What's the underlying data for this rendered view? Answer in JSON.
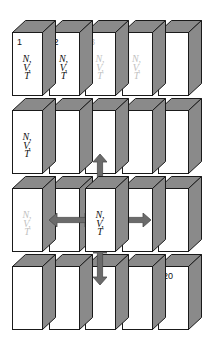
{
  "figure": {
    "kind": "isometric-box-grid",
    "rows": 4,
    "cols": 5,
    "box_fill": "#ffffff",
    "box_shade": "#8a8a8a",
    "box_outline": "#1a1a1a",
    "arrow_color": "#6b6b6b",
    "text_color": "#111111",
    "faded_text_color": "#c2c2c2"
  },
  "ensemble_label": {
    "line1": "N,",
    "line2": "V,",
    "line3": "T"
  },
  "cells": [
    {
      "id": "r1c1",
      "row": 1,
      "col": 1,
      "number": "1",
      "number_faded": false,
      "ensemble": true,
      "ensemble_faded": false,
      "center": false
    },
    {
      "id": "r1c2",
      "row": 1,
      "col": 2,
      "number": "2",
      "number_faded": false,
      "ensemble": true,
      "ensemble_faded": false,
      "center": false
    },
    {
      "id": "r1c3",
      "row": 1,
      "col": 3,
      "number": "3",
      "number_faded": true,
      "ensemble": true,
      "ensemble_faded": true,
      "center": false
    },
    {
      "id": "r1c4",
      "row": 1,
      "col": 4,
      "number": "",
      "number_faded": false,
      "ensemble": true,
      "ensemble_faded": true,
      "center": false
    },
    {
      "id": "r1c5",
      "row": 1,
      "col": 5,
      "number": "",
      "number_faded": false,
      "ensemble": false,
      "ensemble_faded": false,
      "center": false
    },
    {
      "id": "r2c1",
      "row": 2,
      "col": 1,
      "number": "",
      "number_faded": false,
      "ensemble": true,
      "ensemble_faded": false,
      "center": false
    },
    {
      "id": "r2c2",
      "row": 2,
      "col": 2,
      "number": "",
      "number_faded": false,
      "ensemble": false,
      "ensemble_faded": false,
      "center": false
    },
    {
      "id": "r2c3",
      "row": 2,
      "col": 3,
      "number": "",
      "number_faded": false,
      "ensemble": false,
      "ensemble_faded": false,
      "center": false
    },
    {
      "id": "r2c4",
      "row": 2,
      "col": 4,
      "number": "",
      "number_faded": false,
      "ensemble": false,
      "ensemble_faded": false,
      "center": false
    },
    {
      "id": "r2c5",
      "row": 2,
      "col": 5,
      "number": "",
      "number_faded": false,
      "ensemble": false,
      "ensemble_faded": false,
      "center": false
    },
    {
      "id": "r3c1",
      "row": 3,
      "col": 1,
      "number": "",
      "number_faded": false,
      "ensemble": true,
      "ensemble_faded": true,
      "center": false
    },
    {
      "id": "r3c2",
      "row": 3,
      "col": 2,
      "number": "",
      "number_faded": false,
      "ensemble": false,
      "ensemble_faded": false,
      "center": false
    },
    {
      "id": "r3c3",
      "row": 3,
      "col": 3,
      "number": "",
      "number_faded": false,
      "ensemble": true,
      "ensemble_faded": false,
      "center": true
    },
    {
      "id": "r3c4",
      "row": 3,
      "col": 4,
      "number": "",
      "number_faded": false,
      "ensemble": false,
      "ensemble_faded": false,
      "center": false
    },
    {
      "id": "r3c5",
      "row": 3,
      "col": 5,
      "number": "",
      "number_faded": false,
      "ensemble": false,
      "ensemble_faded": false,
      "center": false
    },
    {
      "id": "r4c1",
      "row": 4,
      "col": 1,
      "number": "",
      "number_faded": false,
      "ensemble": false,
      "ensemble_faded": false,
      "center": false
    },
    {
      "id": "r4c2",
      "row": 4,
      "col": 2,
      "number": "",
      "number_faded": false,
      "ensemble": false,
      "ensemble_faded": false,
      "center": false
    },
    {
      "id": "r4c3",
      "row": 4,
      "col": 3,
      "number": "",
      "number_faded": false,
      "ensemble": false,
      "ensemble_faded": false,
      "center": false
    },
    {
      "id": "r4c4",
      "row": 4,
      "col": 4,
      "number": "",
      "number_faded": false,
      "ensemble": false,
      "ensemble_faded": false,
      "center": false
    },
    {
      "id": "r4c5",
      "row": 4,
      "col": 5,
      "number": "20",
      "number_faded": false,
      "ensemble": false,
      "ensemble_faded": false,
      "center": false
    }
  ],
  "arrows": [
    {
      "id": "arrow-up",
      "direction": "up",
      "name": "coupling-arrow-up"
    },
    {
      "id": "arrow-down",
      "direction": "down",
      "name": "coupling-arrow-down"
    },
    {
      "id": "arrow-left",
      "direction": "left",
      "name": "coupling-arrow-left"
    },
    {
      "id": "arrow-right",
      "direction": "right",
      "name": "coupling-arrow-right"
    }
  ],
  "geometry": {
    "origin_x": 12,
    "origin_y": 20,
    "front_w": 30,
    "front_h": 63,
    "col_pitch": 36.5,
    "row_pitch": 78,
    "depth_x": 13,
    "depth_y": 12
  }
}
